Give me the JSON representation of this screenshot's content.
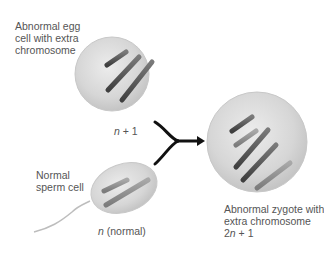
{
  "diagram": {
    "egg": {
      "label_line1": "Abnormal egg",
      "label_line2": "cell with extra",
      "label_line3": "chromosome",
      "ploidy_var": "n",
      "ploidy_rest": " + 1"
    },
    "sperm": {
      "label_line1": "Normal",
      "label_line2": "sperm cell",
      "ploidy_var": "n",
      "ploidy_rest": " (normal)"
    },
    "zygote": {
      "label_line1": "Abnormal zygote with",
      "label_line2": "extra chromosome",
      "ploidy_prefix": "2",
      "ploidy_var": "n",
      "ploidy_rest": " + 1"
    },
    "colors": {
      "cell_fill": "#d9d9d9",
      "cell_edge": "#bdbdbd",
      "chromosome_dark": "#555555",
      "chromosome_light": "#8c8c8c",
      "arrow": "#111111"
    }
  }
}
